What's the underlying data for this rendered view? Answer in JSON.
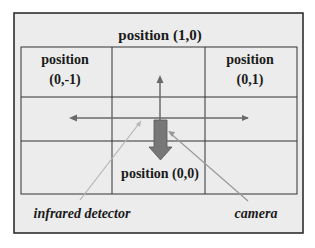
{
  "title": "position (1,0)",
  "cells": {
    "top_left": {
      "line1": "position",
      "line2": "(0,-1)"
    },
    "top_right": {
      "line1": "position",
      "line2": "(0,1)"
    },
    "bottom_center": "position (0,0)"
  },
  "labels": {
    "infrared_detector": "infrared detector",
    "camera": "camera"
  },
  "colors": {
    "background": "#ececec",
    "frame": "#222222",
    "grid": "#333333",
    "arrow": "#6a6a6a",
    "thick_arrow": "#777777",
    "pointer_line": "#b5b5b5"
  }
}
